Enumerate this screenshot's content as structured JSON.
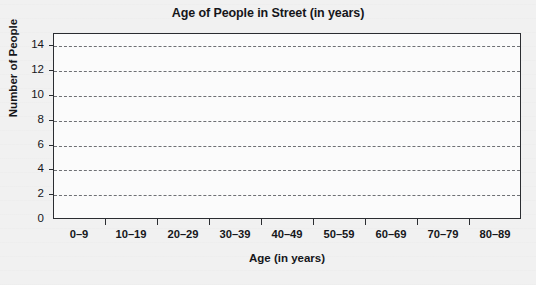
{
  "chart_data": {
    "type": "bar",
    "title": "Age of People in Street (in years)",
    "xlabel": "Age (in years)",
    "ylabel": "Number of People",
    "categories": [
      "0–9",
      "10–19",
      "20–29",
      "30–39",
      "40–49",
      "50–59",
      "60–69",
      "70–79",
      "80–89"
    ],
    "values": [
      null,
      null,
      null,
      null,
      null,
      null,
      null,
      null,
      null
    ],
    "ylim": [
      0,
      15
    ],
    "ytick_labels": [
      "0",
      "2",
      "4",
      "6",
      "8",
      "10",
      "12",
      "14"
    ],
    "ytick_values": [
      0,
      2,
      4,
      6,
      8,
      10,
      12,
      14
    ],
    "gridlines": {
      "horizontal": true,
      "vertical": false,
      "style": "dashed",
      "at_values": [
        2,
        4,
        6,
        8,
        10,
        12,
        14
      ]
    },
    "legend": null,
    "annotations": [],
    "note": "blank chart template — no bars plotted"
  },
  "colors": {
    "page_background": "#f1f1f1",
    "plot_background": "#fbfbfb",
    "axis": "#2b2d31",
    "gridline": "#6e7074",
    "text": "#15161a"
  }
}
